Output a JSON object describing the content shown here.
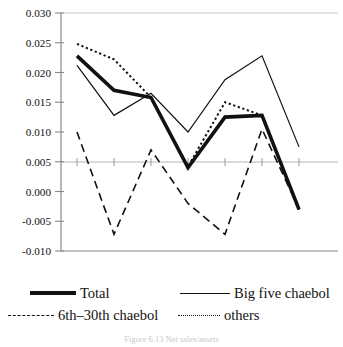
{
  "chart_data": {
    "type": "line",
    "title": "",
    "xlabel": "",
    "ylabel": "",
    "x": [
      "90",
      "91",
      "92",
      "93",
      "94",
      "95",
      "96"
    ],
    "categories": [
      "90",
      "91",
      "92",
      "93",
      "94",
      "95",
      "96"
    ],
    "ylim": [
      -0.01,
      0.03
    ],
    "yticks": [
      0.03,
      0.025,
      0.02,
      0.015,
      0.01,
      0.005,
      0.0,
      -0.005,
      -0.01
    ],
    "ytick_labels": [
      "0.030",
      "0.025",
      "0.020",
      "0.015",
      "0.010",
      "0.005",
      "0.000",
      "-0.005",
      "-0.010"
    ],
    "grid": false,
    "zero_line": true,
    "legend_position": "bottom",
    "series": [
      {
        "name": "Total",
        "style": "thick-solid",
        "values": [
          0.0228,
          0.017,
          0.0158,
          0.004,
          0.0125,
          0.0128,
          -0.003
        ]
      },
      {
        "name": "Big five chaebol",
        "style": "solid",
        "values": [
          0.0212,
          0.0128,
          0.0165,
          0.01,
          0.0188,
          0.0228,
          0.0075
        ]
      },
      {
        "name": "6th–30th chaebol",
        "style": "dashed",
        "values": [
          0.01,
          -0.0072,
          0.007,
          -0.002,
          -0.0072,
          0.0105,
          -0.003
        ]
      },
      {
        "name": "others",
        "style": "dotted",
        "values": [
          0.0248,
          0.0222,
          0.0158,
          0.0042,
          0.015,
          0.0128,
          -0.0032
        ]
      }
    ]
  },
  "legend": {
    "items": [
      {
        "label": "Total",
        "icon": "thick-line-swatch"
      },
      {
        "label": "Big five chaebol",
        "icon": "solid-line-swatch"
      },
      {
        "label": "6th–30th chaebol",
        "icon": "dashed-line-swatch"
      },
      {
        "label": "others",
        "icon": "dotted-line-swatch"
      }
    ]
  },
  "caption": {
    "text": "Figure 6.13  Net sales/assets"
  }
}
